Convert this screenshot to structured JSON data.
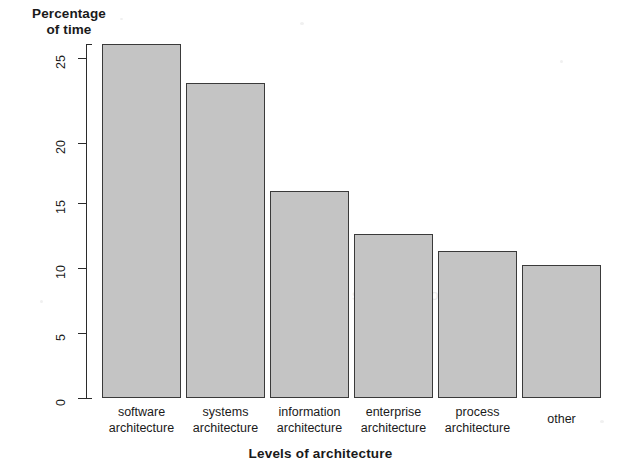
{
  "chart_data": {
    "type": "bar",
    "title": "",
    "ylabel": "Percentage\nof time",
    "xlabel": "Levels of architecture",
    "categories": [
      "software\narchitecture",
      "systems\narchitecture",
      "information\narchitecture",
      "enterprise\narchitecture",
      "process\narchitecture",
      "other"
    ],
    "values": [
      27.2,
      24.2,
      15.9,
      12.6,
      11.3,
      10.2
    ],
    "ylim": [
      0,
      27.5
    ],
    "yticks": [
      "0",
      "5",
      "10",
      "15",
      "20",
      "25"
    ],
    "ytick_values": [
      0,
      5,
      10,
      15,
      20,
      25
    ],
    "grid": false,
    "legend": null,
    "bar_fill": "#c4c4c4",
    "bar_border": "#3a3a3a",
    "axis_color": "#2b2b2b"
  },
  "watermark": {
    "text": "scanned document"
  }
}
